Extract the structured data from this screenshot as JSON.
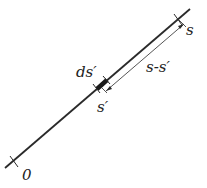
{
  "diagram": {
    "labels": {
      "origin": "0",
      "end": "s",
      "element": "ds′",
      "position": "s′",
      "distance": "s-s′"
    },
    "colors": {
      "line": "#2a2a2a",
      "text": "#222222",
      "background": "#ffffff"
    }
  }
}
